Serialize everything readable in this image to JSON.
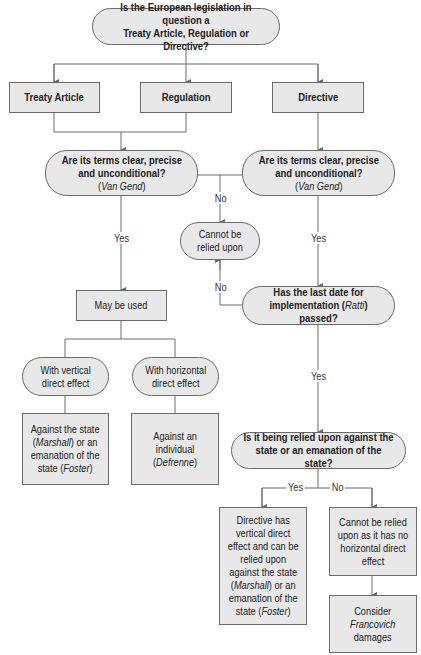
{
  "diagram": {
    "type": "flowchart",
    "colors": {
      "node_fill": "#e8e8e8",
      "node_border": "#6a6a6a",
      "line": "#6a6a6a",
      "background": "#ffffff"
    },
    "nodes": {
      "start": {
        "line1": "Is the European legislation in question a",
        "line2": "Treaty Article, Regulation or Directive?"
      },
      "treaty": {
        "label": "Treaty Article"
      },
      "regulation": {
        "label": "Regulation"
      },
      "directive": {
        "label": "Directive"
      },
      "q_left": {
        "line1": "Are its terms clear, precise",
        "line2": "and unconditional?",
        "case_pre": "(",
        "case": "Van Gend",
        "case_post": ")"
      },
      "q_right": {
        "line1": "Are its terms clear, precise",
        "line2": "and unconditional?",
        "case_pre": "(",
        "case": "Van Gend",
        "case_post": ")"
      },
      "cannot": {
        "line1": "Cannot be",
        "line2": "relied upon"
      },
      "may_be_used": {
        "label": "May be used"
      },
      "last_date": {
        "line1": "Has the last date for",
        "line2_pre": "implementation (",
        "case": "Ratti",
        "line2_post": ") passed?"
      },
      "vertical": {
        "line1": "With vertical",
        "line2": "direct effect"
      },
      "horizontal": {
        "line1": "With horizontal",
        "line2": "direct effect"
      },
      "against_state": {
        "line1": "Against the state",
        "case1": "Marshall",
        "line2_post": ") or an",
        "line3": "emanation of the",
        "line4_pre": "state (",
        "case2": "Foster",
        "line4_post": ")"
      },
      "against_individual": {
        "line1": "Against an",
        "line2": "individual",
        "case": "Defrenne"
      },
      "relied_against": {
        "line1": "Is it being relied upon against the",
        "line2": "state or an emanation of the state?"
      },
      "directive_has": {
        "line1": "Directive has",
        "line2": "vertical direct",
        "line3": "effect and can be",
        "line4": "relied upon",
        "line5": "against the state",
        "case1": "Marshall",
        "line6_post": ") or an",
        "line7": "emanation of the",
        "line8_pre": "state (",
        "case2": "Foster",
        "line8_post": ")"
      },
      "cannot_horizontal": {
        "line1": "Cannot be relied",
        "line2": "upon as it has no",
        "line3": "horizontal direct",
        "line4": "effect"
      },
      "francovich": {
        "line1": "Consider",
        "case": "Francovich",
        "line3": "damages"
      }
    },
    "edge_labels": {
      "no_top": "No",
      "yes_left": "Yes",
      "yes_right": "Yes",
      "no_ratti": "No",
      "yes_ratti": "Yes",
      "yes_state": "Yes",
      "no_state": "No"
    }
  }
}
